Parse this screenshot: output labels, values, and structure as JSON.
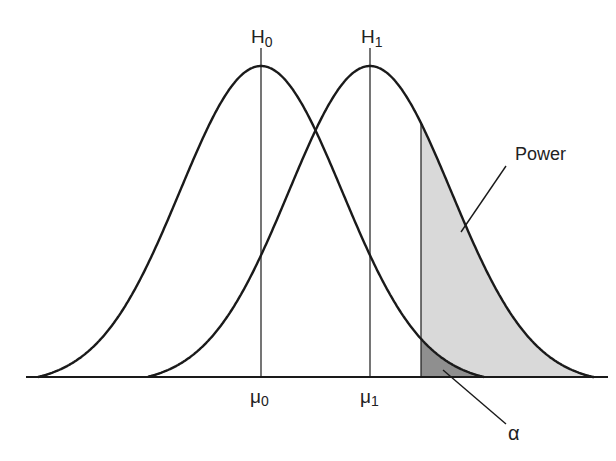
{
  "chart_data": {
    "type": "area",
    "title": "",
    "distributions": [
      {
        "name": "H0",
        "label": "H",
        "subscript": "0",
        "mean_label": "μ",
        "mean_subscript": "0",
        "center_x": 261,
        "start_x": 38,
        "end_x": 484
      },
      {
        "name": "H1",
        "label": "H",
        "subscript": "1",
        "mean_label": "μ",
        "mean_subscript": "1",
        "center_x": 370,
        "start_x": 148,
        "end_x": 594
      }
    ],
    "critical_value_x": 421,
    "regions": [
      {
        "name": "Power",
        "label": "Power",
        "color": "#d9d9d9"
      },
      {
        "name": "alpha",
        "label": "α",
        "color": "#8c8c8c"
      }
    ],
    "baseline": {
      "y": 377,
      "x_start": 26,
      "x_end": 608
    },
    "peak_y": 66,
    "grid": false
  },
  "labels": {
    "h0_main": "H",
    "h0_sub": "0",
    "h1_main": "H",
    "h1_sub": "1",
    "mu0_main": "μ",
    "mu0_sub": "0",
    "mu1_main": "μ",
    "mu1_sub": "1",
    "power": "Power",
    "alpha": "α"
  },
  "colors": {
    "line": "#1a1a1a",
    "power_fill": "#d9d9d9",
    "alpha_fill": "#8f8f8f"
  }
}
